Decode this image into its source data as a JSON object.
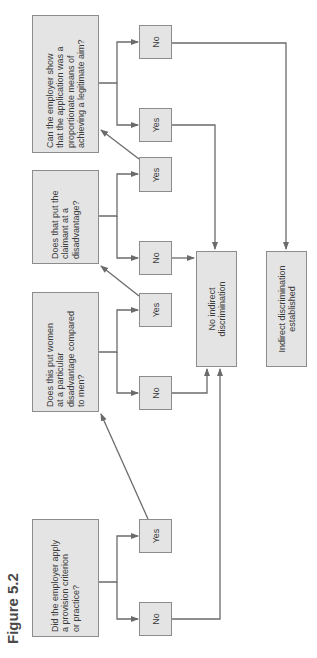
{
  "figure": {
    "label": "Figure 5.2"
  },
  "colors": {
    "box_fill": "#e4e4e4",
    "box_border": "#8c8c8c",
    "line": "#6b6b6b",
    "text": "#3a3a3a"
  },
  "questions": [
    {
      "id": "q1",
      "text": "Did the employer apply\na provision criterion\nor practice?"
    },
    {
      "id": "q2",
      "text": "Does this put women\nat a particular\ndisadvantage compared\nto men?"
    },
    {
      "id": "q3",
      "text": "Does that put the\nclaimant at a\ndisadvantage?"
    },
    {
      "id": "q4",
      "text": "Can the employer show\nthat the application was a\nproportionate means of\nachieving a legitimate aim?"
    }
  ],
  "answers": {
    "q1_no": "No",
    "q1_yes": "Yes",
    "q2_no": "No",
    "q2_yes": "Yes",
    "q3_no": "No",
    "q3_yes": "Yes",
    "q4_yes": "Yes",
    "q4_no": "No"
  },
  "outcomes": {
    "no_discrimination": "No indirect\ndiscrimination",
    "discrimination": "Indirect discrimination\nestablished"
  }
}
